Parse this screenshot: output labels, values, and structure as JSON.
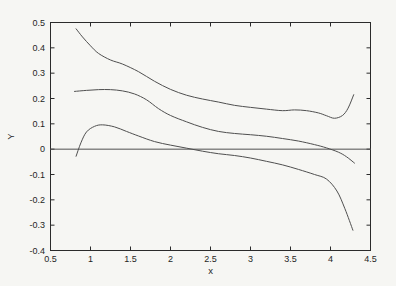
{
  "chart_data": {
    "type": "line",
    "title": "",
    "xlabel": "x",
    "ylabel": "Y",
    "xlim": [
      0.5,
      4.5
    ],
    "ylim": [
      -0.4,
      0.5
    ],
    "grid": false,
    "legend": "none",
    "box": true,
    "xticks": {
      "values": [
        0.5,
        1,
        1.5,
        2,
        2.5,
        3,
        3.5,
        4,
        4.5
      ],
      "labels": [
        "0.5",
        "1",
        "1.5",
        "2",
        "2.5",
        "3",
        "3.5",
        "4",
        "4.5"
      ]
    },
    "yticks": {
      "values": [
        -0.4,
        -0.3,
        -0.2,
        -0.1,
        0,
        0.1,
        0.2,
        0.3,
        0.4,
        0.5
      ],
      "labels": [
        "-0.4",
        "-0.3",
        "-0.2",
        "-0.1",
        "0",
        "0.1",
        "0.2",
        "0.3",
        "0.4",
        "0.5"
      ]
    },
    "series": [
      {
        "name": "upper-confidence-band",
        "x": [
          0.82,
          0.9,
          1.0,
          1.1,
          1.25,
          1.4,
          1.6,
          1.8,
          2.0,
          2.2,
          2.4,
          2.6,
          2.8,
          3.0,
          3.2,
          3.4,
          3.55,
          3.7,
          3.85,
          3.95,
          4.05,
          4.15,
          4.22,
          4.29
        ],
        "y": [
          0.475,
          0.443,
          0.408,
          0.378,
          0.352,
          0.336,
          0.306,
          0.268,
          0.236,
          0.213,
          0.198,
          0.186,
          0.173,
          0.165,
          0.158,
          0.152,
          0.155,
          0.152,
          0.143,
          0.132,
          0.122,
          0.133,
          0.162,
          0.215
        ]
      },
      {
        "name": "fitted-curve",
        "x": [
          0.8,
          0.95,
          1.1,
          1.25,
          1.4,
          1.55,
          1.7,
          1.85,
          2.0,
          2.2,
          2.4,
          2.6,
          2.8,
          3.0,
          3.2,
          3.4,
          3.6,
          3.8,
          3.95,
          4.1,
          4.2,
          4.3
        ],
        "y": [
          0.228,
          0.232,
          0.235,
          0.235,
          0.23,
          0.218,
          0.195,
          0.16,
          0.133,
          0.108,
          0.086,
          0.07,
          0.062,
          0.057,
          0.051,
          0.042,
          0.032,
          0.018,
          0.005,
          -0.012,
          -0.03,
          -0.055
        ]
      },
      {
        "name": "lower-confidence-band",
        "x": [
          0.82,
          0.88,
          0.95,
          1.05,
          1.15,
          1.3,
          1.45,
          1.6,
          1.8,
          2.0,
          2.2,
          2.4,
          2.6,
          2.8,
          3.0,
          3.2,
          3.4,
          3.6,
          3.8,
          3.95,
          4.08,
          4.18,
          4.28
        ],
        "y": [
          -0.028,
          0.025,
          0.068,
          0.09,
          0.096,
          0.088,
          0.07,
          0.052,
          0.03,
          0.016,
          0.004,
          -0.008,
          -0.018,
          -0.025,
          -0.035,
          -0.048,
          -0.062,
          -0.08,
          -0.1,
          -0.118,
          -0.165,
          -0.235,
          -0.32
        ]
      },
      {
        "name": "zero-reference-line",
        "x": [
          0.5,
          4.5
        ],
        "y": [
          0,
          0
        ]
      }
    ],
    "colors": {
      "curve": "#4f4f4f",
      "axis": "#2b2b2b",
      "text": "#1f1f1f",
      "background": "#f6f6f3"
    }
  }
}
